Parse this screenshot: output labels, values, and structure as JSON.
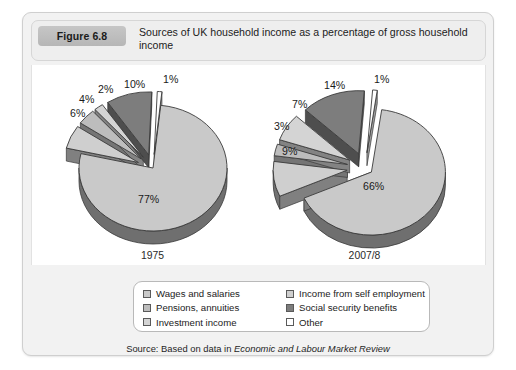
{
  "figure": {
    "badge": "Figure 6.8",
    "title": "Sources of UK household income as a percentage of gross household income",
    "source_prefix": "Source: Based on data in ",
    "source_journal": "Economic and Labour Market Review"
  },
  "colors": {
    "wages": "#c9c9c9",
    "self_employment": "#cfcfcf",
    "pensions": "#bdbdbd",
    "social_security": "#7d7d7d",
    "investment": "#d4d4d4",
    "other": "#ffffff",
    "edge": "#3a3a3a",
    "depth": "#6e6e6e",
    "badge": "#bdbdbd",
    "card_bg": "#f2f2f2",
    "plot_bg": "#ffffff"
  },
  "legend": {
    "columns": [
      {
        "items": [
          {
            "label": "Wages and salaries",
            "swatch": "#c9c9c9"
          },
          {
            "label": "Pensions, annuities",
            "swatch": "#bdbdbd"
          },
          {
            "label": "Investment income",
            "swatch": "#d4d4d4"
          }
        ]
      },
      {
        "items": [
          {
            "label": "Income from self employment",
            "swatch": "#cfcfcf"
          },
          {
            "label": "Social security benefits",
            "swatch": "#7d7d7d"
          },
          {
            "label": "Other",
            "swatch": "#ffffff"
          }
        ]
      }
    ]
  },
  "chart_data": {
    "type": "pie",
    "title": "Sources of UK household income as a percentage of gross household income",
    "xlabel": "",
    "ylabel": "",
    "unit": "percent",
    "legend_position": "bottom",
    "grid": false,
    "categories": [
      "Wages and salaries",
      "Income from self employment",
      "Pensions, annuities",
      "Social security benefits",
      "Investment income",
      "Other"
    ],
    "charts": [
      {
        "name": "1975",
        "year_label": "1975",
        "slices": [
          {
            "label": "Wages and salaries",
            "value": 77,
            "display": "77%",
            "color": "#c9c9c9"
          },
          {
            "label": "Income from self employment",
            "value": 6,
            "display": "6%",
            "color": "#cfcfcf"
          },
          {
            "label": "Pensions, annuities",
            "value": 4,
            "display": "4%",
            "color": "#bdbdbd"
          },
          {
            "label": "Investment income",
            "value": 2,
            "display": "2%",
            "color": "#d4d4d4"
          },
          {
            "label": "Social security benefits",
            "value": 10,
            "display": "10%",
            "color": "#7d7d7d"
          },
          {
            "label": "Other",
            "value": 1,
            "display": "1%",
            "color": "#ffffff"
          }
        ]
      },
      {
        "name": "2007/8",
        "year_label": "2007/8",
        "slices": [
          {
            "label": "Wages and salaries",
            "value": 66,
            "display": "66%",
            "color": "#c9c9c9"
          },
          {
            "label": "Income from self employment",
            "value": 9,
            "display": "9%",
            "color": "#cfcfcf"
          },
          {
            "label": "Pensions, annuities",
            "value": 3,
            "display": "3%",
            "color": "#bdbdbd"
          },
          {
            "label": "Investment income",
            "value": 7,
            "display": "7%",
            "color": "#d4d4d4"
          },
          {
            "label": "Social security benefits",
            "value": 14,
            "display": "14%",
            "color": "#7d7d7d"
          },
          {
            "label": "Other",
            "value": 1,
            "display": "1%",
            "color": "#ffffff"
          }
        ]
      }
    ]
  }
}
